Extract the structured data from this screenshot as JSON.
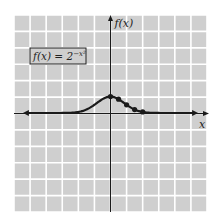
{
  "chart_data": {
    "type": "line",
    "title": "",
    "function_label": {
      "base": "f(x) = 2",
      "exponent": "−x²"
    },
    "xlabel": "x",
    "ylabel": "f(x)",
    "xlim": [
      -6,
      6
    ],
    "ylim": [
      -6,
      6
    ],
    "grid": true,
    "grid_step": 1,
    "series": [
      {
        "name": "f(x) = 2^(-x^2)",
        "sample_points": [
          {
            "x": 0,
            "y": 1
          },
          {
            "x": 0.5,
            "y": 0.841
          },
          {
            "x": 1,
            "y": 0.5
          },
          {
            "x": 1.5,
            "y": 0.21
          },
          {
            "x": 2,
            "y": 0.0625
          }
        ]
      }
    ],
    "colors": {
      "background": "#cfcfcf",
      "grid": "#ffffff",
      "curve": "#1a1a1a",
      "axis": "#1a1a1a"
    }
  }
}
